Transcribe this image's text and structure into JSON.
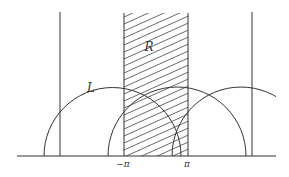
{
  "diagram": {
    "type": "geometric-figure",
    "colors": {
      "stroke": "#333333",
      "hatch": "#444444",
      "background": "#ffffff"
    },
    "baseline": {
      "x1": 17,
      "x2": 276,
      "y": 156
    },
    "vertical_lines": [
      {
        "name": "left-vertical",
        "x": 60,
        "y_top": 12
      },
      {
        "name": "right-vertical",
        "x": 252,
        "y_top": 12
      }
    ],
    "strip": {
      "x_left": 124,
      "x_right": 188,
      "y_top": 13,
      "hatch_spacing": 7,
      "hatch_slope": -0.45
    },
    "semicircles": [
      {
        "name": "L",
        "cx": 112.5,
        "r": 68.5
      },
      {
        "name": "middle",
        "cx": 177,
        "r": 69
      },
      {
        "name": "right",
        "cx": 241,
        "r": 69,
        "clip_x": 276
      }
    ],
    "labels": {
      "region": {
        "text": "R",
        "x": 149,
        "y": 51
      },
      "curve": {
        "text": "L",
        "x": 91,
        "y": 92
      },
      "neg_pi": {
        "text": "−π",
        "x": 123,
        "y": 167
      },
      "pi": {
        "text": "π",
        "x": 187,
        "y": 167
      }
    }
  }
}
